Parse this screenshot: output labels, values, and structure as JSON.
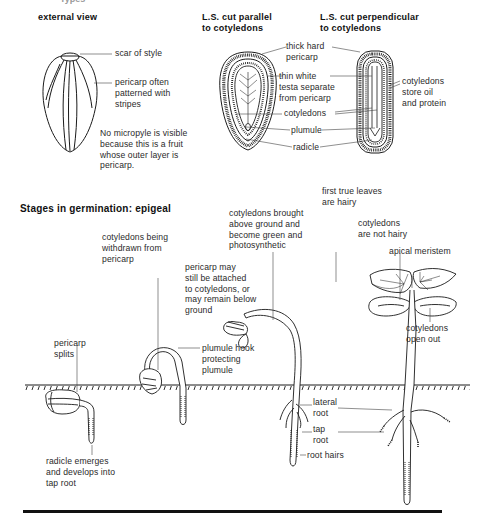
{
  "page": {
    "partial_title": "Types"
  },
  "external_view": {
    "heading": "external view",
    "labels": {
      "scar": "scar of style",
      "pericarp": "pericarp often\npatterned with\nstripes"
    },
    "note": "No micropyle is visible\nbecause this is a fruit\nwhose outer layer is\npericarp."
  },
  "ls_parallel": {
    "heading": "L.S. cut parallel\nto cotyledons"
  },
  "ls_perpendicular": {
    "heading": "L.S. cut perpendicular\nto cotyledons"
  },
  "section_labels": {
    "thick_pericarp": "thick hard\npericarp",
    "testa": "thin white\ntesta separate\nfrom pericarp",
    "cotyledons": "cotyledons",
    "plumule": "plumule",
    "radicle": "radicle",
    "cotyledons_store": "cotyledons\nstore oil\nand protein"
  },
  "germination": {
    "heading": "Stages in germination: epigeal",
    "labels": {
      "pericarp_splits": "pericarp\nsplits",
      "radicle_emerges": "radicle emerges\nand develops into\ntap root",
      "cotyledons_withdrawn": "cotyledons being\nwithdrawn from\npericarp",
      "plumule_hook": "plumule hook\nprotecting\nplumule",
      "pericarp_attached": "pericarp may\nstill be attached\nto cotyledons, or\nmay remain below\nground",
      "cotyledons_brought": "cotyledons brought\nabove ground and\nbecome green and\nphotosynthetic",
      "first_true_leaves": "first true leaves\nare hairy",
      "cotyledons_not_hairy": "cotyledons\nare not hairy",
      "apical_meristem": "apical meristem",
      "cotyledons_open": "cotyledons\nopen out",
      "lateral_root": "lateral\nroot",
      "tap_root": "tap\nroot",
      "root_hairs": "root hairs"
    }
  },
  "colors": {
    "ink": "#1a1a1a",
    "background": "#ffffff"
  }
}
